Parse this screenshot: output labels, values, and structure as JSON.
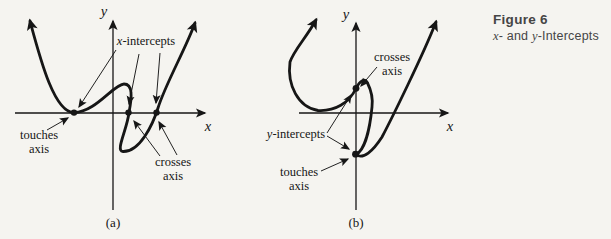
{
  "colors": {
    "background": "#f5f4f0",
    "ink": "#161616",
    "caption_text": "#454545"
  },
  "caption": {
    "title": "Figure 6",
    "subtitle": {
      "var1": "x",
      "mid": "- and ",
      "var2": "y",
      "rest": "-Intercepts"
    }
  },
  "panel_a": {
    "tag": "(a)",
    "x_axis_label": "x",
    "y_axis_label": "y",
    "x_intercepts": {
      "var": "x",
      "rest": "-intercepts"
    },
    "touches": {
      "line1": "touches",
      "line2": "axis"
    },
    "crosses": {
      "line1": "crosses",
      "line2": "axis"
    }
  },
  "panel_b": {
    "tag": "(b)",
    "x_axis_label": "x",
    "y_axis_label": "y",
    "y_intercepts": {
      "var": "y",
      "rest": "-intercepts"
    },
    "crosses": {
      "line1": "crosses",
      "line2": "axis"
    },
    "touches": {
      "line1": "touches",
      "line2": "axis"
    }
  }
}
